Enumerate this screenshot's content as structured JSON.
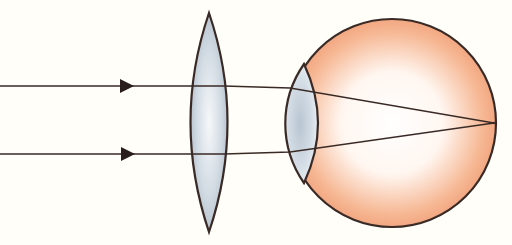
{
  "diagram": {
    "type": "optics-ray-diagram",
    "canvas": {
      "width": 512,
      "height": 245,
      "background": "#fffef8"
    },
    "colors": {
      "stroke": "#3a2a26",
      "lens_fill_center": "#f4f6f8",
      "lens_fill_edge": "#aab8c6",
      "eye_fill_center": "#ffffff",
      "eye_fill_edge": "#f0a07a",
      "arrow": "#2a1e1c"
    },
    "rays": [
      {
        "id": "ray-top",
        "y_start": 86,
        "arrow_x": 126
      },
      {
        "id": "ray-bottom",
        "y_start": 154,
        "arrow_x": 126
      }
    ],
    "corrective_lens": {
      "kind": "biconvex",
      "center_x": 209,
      "top_y": 13,
      "bottom_y": 232,
      "half_width": 25
    },
    "eyeball": {
      "center_x": 392,
      "center_y": 123,
      "radius": 104
    },
    "eye_lens": {
      "top": [
        304,
        64
      ],
      "bottom": [
        304,
        183
      ]
    },
    "focal_point": [
      494,
      123
    ],
    "labels": []
  }
}
